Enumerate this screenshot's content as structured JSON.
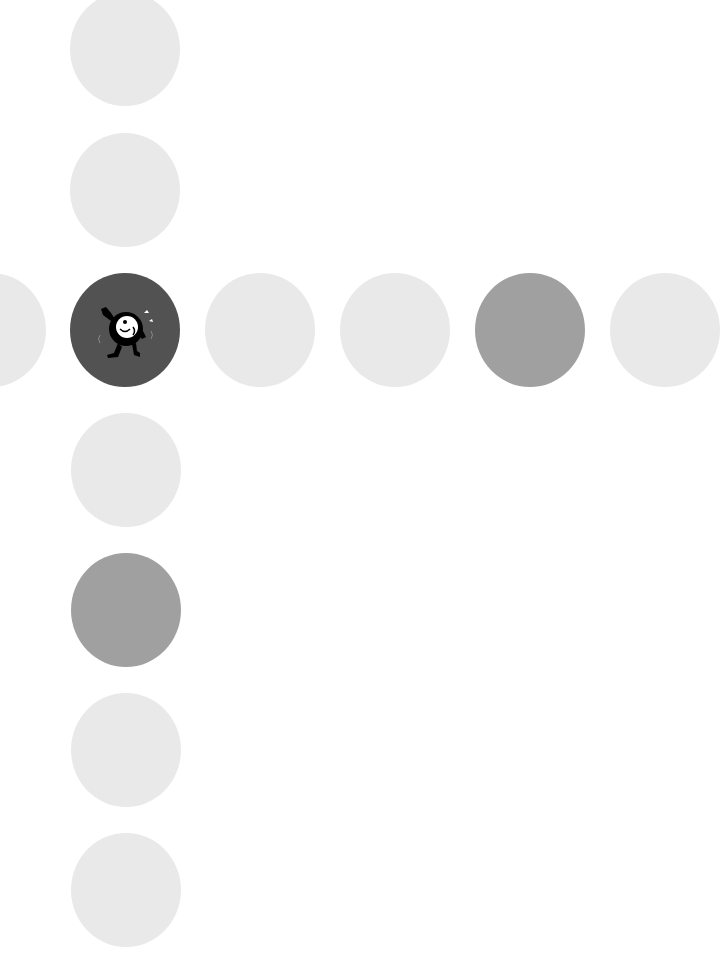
{
  "board": {
    "colors": {
      "light": "#e9e9e9",
      "medium": "#a0a0a0",
      "dark": "#525252",
      "background": "#ffffff"
    },
    "cells": [
      {
        "id": "v0",
        "x": 70,
        "y": -8,
        "state": "light"
      },
      {
        "id": "v1",
        "x": 70,
        "y": 133,
        "state": "light"
      },
      {
        "id": "h0",
        "x": -64,
        "y": 273,
        "state": "light"
      },
      {
        "id": "c",
        "x": 70,
        "y": 273,
        "state": "dark",
        "icon": "running-ball-character-icon"
      },
      {
        "id": "h2",
        "x": 205,
        "y": 273,
        "state": "light"
      },
      {
        "id": "h3",
        "x": 340,
        "y": 273,
        "state": "light"
      },
      {
        "id": "h4",
        "x": 475,
        "y": 273,
        "state": "medium"
      },
      {
        "id": "h5",
        "x": 610,
        "y": 273,
        "state": "light"
      },
      {
        "id": "v3",
        "x": 71,
        "y": 413,
        "state": "light"
      },
      {
        "id": "v4",
        "x": 71,
        "y": 553,
        "state": "medium"
      },
      {
        "id": "v5",
        "x": 71,
        "y": 693,
        "state": "light"
      },
      {
        "id": "v6",
        "x": 71,
        "y": 833,
        "state": "light"
      }
    ]
  }
}
